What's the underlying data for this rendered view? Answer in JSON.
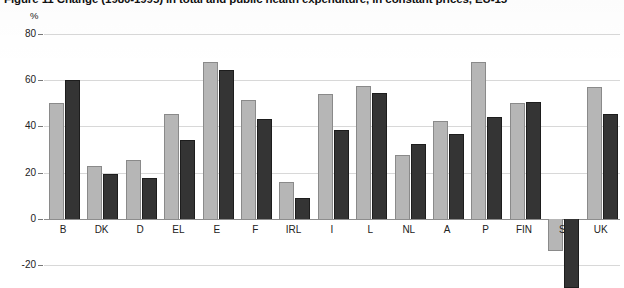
{
  "figure": {
    "title": "Figure 11  Change (1980-1995) in total and public health expenditure, in constant prices, EU-15",
    "unit_label": "%"
  },
  "chart_data": {
    "type": "bar",
    "title": "Figure 11  Change (1980-1995) in total and public health expenditure, in constant prices, EU-15",
    "xlabel": "",
    "ylabel": "%",
    "ylim": [
      -20,
      80
    ],
    "yticks": [
      80,
      60,
      40,
      20,
      0,
      -20
    ],
    "grid": true,
    "legend_position": "none",
    "categories": [
      "B",
      "DK",
      "D",
      "EL",
      "E",
      "F",
      "IRL",
      "I",
      "L",
      "NL",
      "A",
      "P",
      "FIN",
      "S",
      "UK"
    ],
    "series": [
      {
        "name": "Total health expenditure",
        "color": "#b6b6b6",
        "values": [
          50,
          23,
          25.5,
          45.5,
          68,
          51.5,
          16,
          54,
          57.5,
          27.5,
          42.5,
          68,
          50,
          -14,
          57
        ]
      },
      {
        "name": "Public health expenditure",
        "color": "#343434",
        "values": [
          60,
          19.5,
          17.5,
          34,
          64.5,
          43,
          9,
          38.5,
          54.5,
          32.5,
          36.5,
          44,
          50.5,
          -30,
          45.5
        ]
      }
    ]
  }
}
